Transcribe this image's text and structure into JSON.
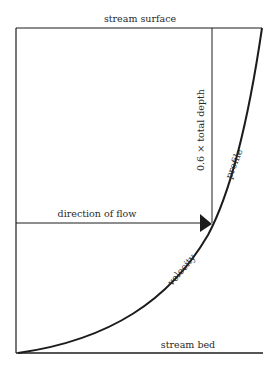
{
  "labels": {
    "surface": "stream surface",
    "bed": "stream bed",
    "flow": "direction of flow",
    "depth": "0.6 × total depth",
    "profile_word": "profile",
    "velocity_word": "velocity"
  },
  "geometry": {
    "frame_left": 16,
    "surface_y": 28,
    "bed_y": 353,
    "bed_right": 263,
    "depth_line_x": 212,
    "arrow_y": 223,
    "curve_top_x": 262
  },
  "colors": {
    "ink": "#1c1c1c",
    "background": "#ffffff"
  }
}
